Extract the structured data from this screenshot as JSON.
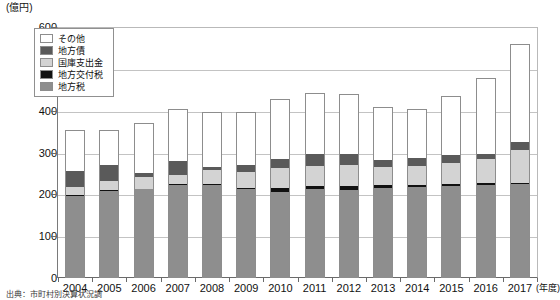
{
  "chart_data": {
    "type": "bar",
    "subtype": "stacked",
    "title": "",
    "xlabel": "(年度)",
    "ylabel": "(億円)",
    "ylim": [
      0,
      600
    ],
    "yticks": [
      0,
      100,
      200,
      300,
      400,
      500,
      600
    ],
    "grid": true,
    "legend_position": "top-left",
    "categories": [
      "2004",
      "2005",
      "2006",
      "2007",
      "2008",
      "2009",
      "2010",
      "2011",
      "2012",
      "2013",
      "2014",
      "2015",
      "2016",
      "2017"
    ],
    "series": [
      {
        "name": "地方税",
        "color": "#8e8e8e",
        "values": [
          196,
          207,
          212,
          223,
          222,
          213,
          206,
          212,
          211,
          216,
          218,
          220,
          223,
          225
        ]
      },
      {
        "name": "地方交付税",
        "color": "#111111",
        "values": [
          3,
          3,
          2,
          2,
          2,
          2,
          8,
          7,
          8,
          6,
          5,
          4,
          3,
          2
        ]
      },
      {
        "name": "国庫支出金",
        "color": "#d3d3d3",
        "values": [
          19,
          22,
          27,
          22,
          34,
          38,
          50,
          48,
          50,
          43,
          44,
          50,
          58,
          78
        ]
      },
      {
        "name": "地方債",
        "color": "#5a5a5a",
        "values": [
          39,
          37,
          10,
          32,
          8,
          18,
          20,
          29,
          27,
          18,
          20,
          20,
          12,
          20
        ]
      },
      {
        "name": "その他",
        "color": "#ffffff",
        "values": [
          98,
          84,
          120,
          124,
          132,
          126,
          143,
          147,
          145,
          125,
          118,
          140,
          182,
          235
        ]
      }
    ],
    "totals": [
      355,
      353,
      371,
      403,
      398,
      397,
      427,
      443,
      441,
      408,
      405,
      434,
      478,
      560
    ]
  },
  "axis": {
    "unit_label": "(億円)",
    "year_unit": "(年度)",
    "y_tick_labels": [
      "0",
      "100",
      "200",
      "300",
      "400",
      "500",
      "600"
    ]
  },
  "legend": {
    "items": [
      {
        "label": "その他",
        "color": "#ffffff"
      },
      {
        "label": "地方債",
        "color": "#5a5a5a"
      },
      {
        "label": "国庫支出金",
        "color": "#d3d3d3"
      },
      {
        "label": "地方交付税",
        "color": "#111111"
      },
      {
        "label": "地方税",
        "color": "#8e8e8e"
      }
    ]
  },
  "source": {
    "note": "出典：市町村別決算状況調"
  }
}
